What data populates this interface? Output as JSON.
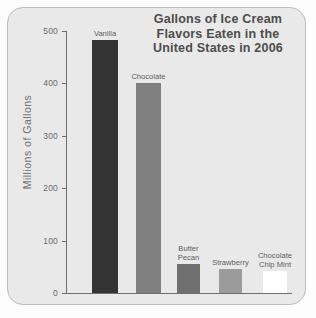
{
  "chart_data": {
    "type": "bar",
    "title": "Gallons of Ice Cream Flavors Eaten in the United States in 2006",
    "title_lines": [
      "Gallons of Ice Cream",
      "Flavors Eaten in the",
      "United States in 2006"
    ],
    "xlabel": "",
    "ylabel": "Millions of Gallons",
    "ylim": [
      0,
      500
    ],
    "yticks": [
      0,
      100,
      200,
      300,
      400,
      500
    ],
    "ytick_labels": [
      "0",
      "100",
      "200",
      "300",
      "400",
      "500"
    ],
    "grid": false,
    "legend": "none",
    "categories": [
      "Vanilla",
      "Chocolate",
      "Butter Pecan",
      "Strawberry",
      "Chocolate Chip Mint"
    ],
    "values": [
      483,
      400,
      55,
      45,
      42
    ],
    "bars": [
      {
        "label": "Vanilla",
        "label_lines": "Vanilla",
        "value": 483,
        "color": "#333333",
        "x": 92,
        "width": 26
      },
      {
        "label": "Chocolate",
        "label_lines": "Chocolate",
        "value": 400,
        "color": "#808080",
        "x": 136,
        "width": 25
      },
      {
        "label": "Butter Pecan",
        "label_lines": "Butter\nPecan",
        "value": 55,
        "color": "#707070",
        "x": 177,
        "width": 23
      },
      {
        "label": "Strawberry",
        "label_lines": "Strawberry",
        "value": 45,
        "color": "#9b9b9b",
        "x": 219,
        "width": 23
      },
      {
        "label": "Chocolate Chip Mint",
        "label_lines": "Chocolate\nChip Mint",
        "value": 42,
        "color": "#ffffff",
        "x": 263,
        "width": 24
      }
    ],
    "colors": {
      "panel_background": "#e9e9e9",
      "panel_border": "#bdbdbd",
      "axis": "#6e6e6e",
      "title_text": "#4c4c4c",
      "tick_text": "#6a6a6a",
      "axis_label_text": "#707070",
      "bar_label_text": "#5d5d5d"
    }
  }
}
